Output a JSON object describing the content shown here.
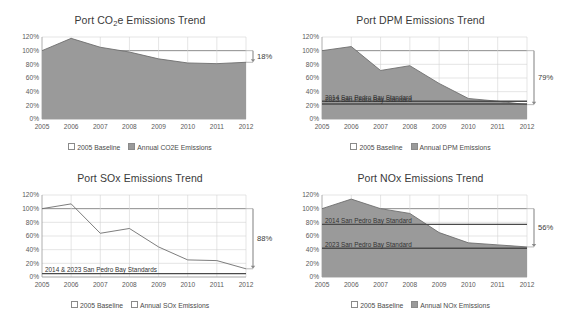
{
  "figure": {
    "background": "#ffffff",
    "fill_color": "#9a9a9a",
    "line_color": "#6e6e6e",
    "grid_color": "#d4d4d4",
    "axis_color": "#9b9b9b",
    "standard_line_color": "#4a4a4a"
  },
  "charts": [
    {
      "id": "co2e",
      "title_prefix": "Port CO",
      "title_sub": "2",
      "title_suffix": "e Emissions Trend",
      "title_plain": "Port CO2e Emissions Trend",
      "filled": true,
      "annotation": "18%",
      "annotation_direction": "down",
      "legend": [
        {
          "label": "2005 Baseline",
          "marker": "hollow"
        },
        {
          "label": "Annual CO2E Emissions",
          "marker": "filled"
        }
      ],
      "standards": [],
      "chart_data": {
        "type": "area",
        "title": "Port CO2e Emissions Trend",
        "xlabel": "",
        "ylabel": "",
        "ylim": [
          0,
          120
        ],
        "yticks": [
          0,
          20,
          40,
          60,
          80,
          100,
          120
        ],
        "ytick_labels": [
          "0%",
          "20%",
          "40%",
          "60%",
          "80%",
          "100%",
          "120%"
        ],
        "grid": true,
        "legend_position": "bottom",
        "categories": [
          2005,
          2006,
          2007,
          2008,
          2009,
          2010,
          2011,
          2012
        ],
        "x": [
          "2005",
          "2006",
          "2007",
          "2008",
          "2009",
          "2010",
          "2011",
          "2012"
        ],
        "series": [
          {
            "name": "2005 Baseline",
            "values": [
              100,
              100,
              100,
              100,
              100,
              100,
              100,
              100
            ]
          },
          {
            "name": "Annual CO2E Emissions",
            "values": [
              100,
              118,
              105,
              98,
              88,
              82,
              81,
              83
            ]
          }
        ],
        "annotations": [
          {
            "text": "18%",
            "meaning": "reduction from 2005 baseline to 2012",
            "from": 100,
            "to": 83
          }
        ]
      }
    },
    {
      "id": "dpm",
      "title_prefix": "Port DPM Emissions Trend",
      "title_sub": "",
      "title_suffix": "",
      "title_plain": "Port DPM Emissions Trend",
      "filled": true,
      "annotation": "79%",
      "annotation_direction": "down",
      "legend": [
        {
          "label": "2005 Baseline",
          "marker": "hollow"
        },
        {
          "label": "Annual DPM Emissions",
          "marker": "filled"
        }
      ],
      "standards": [
        {
          "label": "2014 San Pedro Bay Standard",
          "value": 26
        },
        {
          "label": "2023 San Pedro Bay Standard",
          "value": 22
        }
      ],
      "chart_data": {
        "type": "area",
        "title": "Port DPM Emissions Trend",
        "xlabel": "",
        "ylabel": "",
        "ylim": [
          0,
          120
        ],
        "yticks": [
          0,
          20,
          40,
          60,
          80,
          100,
          120
        ],
        "ytick_labels": [
          "0%",
          "20%",
          "40%",
          "60%",
          "80%",
          "100%",
          "120%"
        ],
        "grid": true,
        "legend_position": "bottom",
        "categories": [
          2005,
          2006,
          2007,
          2008,
          2009,
          2010,
          2011,
          2012
        ],
        "x": [
          "2005",
          "2006",
          "2007",
          "2008",
          "2009",
          "2010",
          "2011",
          "2012"
        ],
        "series": [
          {
            "name": "2005 Baseline",
            "values": [
              100,
              100,
              100,
              100,
              100,
              100,
              100,
              100
            ]
          },
          {
            "name": "Annual DPM Emissions",
            "values": [
              100,
              106,
              71,
              78,
              52,
              30,
              26,
              21
            ]
          }
        ],
        "reference_lines": [
          {
            "label": "2014 San Pedro Bay Standard",
            "value": 26
          },
          {
            "label": "2023 San Pedro Bay Standard",
            "value": 22
          }
        ],
        "annotations": [
          {
            "text": "79%",
            "meaning": "reduction from 2005 baseline to 2012",
            "from": 100,
            "to": 21
          }
        ]
      }
    },
    {
      "id": "sox",
      "title_prefix": "Port SOx Emissions Trend",
      "title_sub": "",
      "title_suffix": "",
      "title_plain": "Port SOx Emissions Trend",
      "filled": false,
      "annotation": "88%",
      "annotation_direction": "down",
      "legend": [
        {
          "label": "2005 Baseline",
          "marker": "hollow"
        },
        {
          "label": "Annual SOx Emissions",
          "marker": "hollow"
        }
      ],
      "standards": [
        {
          "label": "2014 & 2023 San Pedro Bay Standards",
          "value": 5
        }
      ],
      "chart_data": {
        "type": "area",
        "title": "Port SOx Emissions Trend",
        "xlabel": "",
        "ylabel": "",
        "ylim": [
          0,
          120
        ],
        "yticks": [
          0,
          20,
          40,
          60,
          80,
          100,
          120
        ],
        "ytick_labels": [
          "0%",
          "20%",
          "40%",
          "60%",
          "80%",
          "100%",
          "120%"
        ],
        "grid": true,
        "legend_position": "bottom",
        "categories": [
          2005,
          2006,
          2007,
          2008,
          2009,
          2010,
          2011,
          2012
        ],
        "x": [
          "2005",
          "2006",
          "2007",
          "2008",
          "2009",
          "2010",
          "2011",
          "2012"
        ],
        "series": [
          {
            "name": "2005 Baseline",
            "values": [
              100,
              100,
              100,
              100,
              100,
              100,
              100,
              100
            ]
          },
          {
            "name": "Annual SOx Emissions",
            "values": [
              100,
              107,
              64,
              71,
              44,
              25,
              24,
              12
            ]
          }
        ],
        "reference_lines": [
          {
            "label": "2014 & 2023 San Pedro Bay Standards",
            "value": 5
          }
        ],
        "annotations": [
          {
            "text": "88%",
            "meaning": "reduction from 2005 baseline to 2012",
            "from": 100,
            "to": 12
          }
        ]
      }
    },
    {
      "id": "nox",
      "title_prefix": "Port NOx Emissions Trend",
      "title_sub": "",
      "title_suffix": "",
      "title_plain": "Port NOx Emissions Trend",
      "filled": true,
      "annotation": "56%",
      "annotation_direction": "down",
      "legend": [
        {
          "label": "2005 Baseline",
          "marker": "hollow"
        },
        {
          "label": "Annual NOx Emissions",
          "marker": "filled"
        }
      ],
      "standards": [
        {
          "label": "2014 San Pedro Bay Standard",
          "value": 77
        },
        {
          "label": "2023 San Pedro Bay Standard",
          "value": 42
        }
      ],
      "chart_data": {
        "type": "area",
        "title": "Port NOx Emissions Trend",
        "xlabel": "",
        "ylabel": "",
        "ylim": [
          0,
          120
        ],
        "yticks": [
          0,
          20,
          40,
          60,
          80,
          100,
          120
        ],
        "ytick_labels": [
          "0%",
          "20%",
          "40%",
          "60%",
          "80%",
          "100%",
          "120%"
        ],
        "grid": true,
        "legend_position": "bottom",
        "categories": [
          2005,
          2006,
          2007,
          2008,
          2009,
          2010,
          2011,
          2012
        ],
        "x": [
          "2005",
          "2006",
          "2007",
          "2008",
          "2009",
          "2010",
          "2011",
          "2012"
        ],
        "series": [
          {
            "name": "2005 Baseline",
            "values": [
              100,
              100,
              100,
              100,
              100,
              100,
              100,
              100
            ]
          },
          {
            "name": "Annual NOx Emissions",
            "values": [
              100,
              114,
              100,
              93,
              65,
              50,
              47,
              44
            ]
          }
        ],
        "reference_lines": [
          {
            "label": "2014 San Pedro Bay Standard",
            "value": 77
          },
          {
            "label": "2023 San Pedro Bay Standard",
            "value": 42
          }
        ],
        "annotations": [
          {
            "text": "56%",
            "meaning": "reduction from 2005 baseline to 2012",
            "from": 100,
            "to": 44
          }
        ]
      }
    }
  ]
}
